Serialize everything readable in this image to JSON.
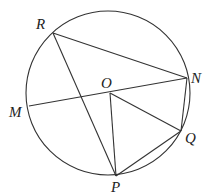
{
  "diagram": {
    "type": "circle-geometry",
    "circle": {
      "center": "O",
      "cx": 108,
      "cy": 93,
      "r": 82
    },
    "points": [
      {
        "name": "R",
        "x": 53,
        "y": 33,
        "lx": 36,
        "ly": 29
      },
      {
        "name": "N",
        "x": 187,
        "y": 78,
        "lx": 191,
        "ly": 83
      },
      {
        "name": "O",
        "x": 110,
        "y": 93,
        "lx": 103,
        "ly": 88
      },
      {
        "name": "M",
        "x": 29,
        "y": 106,
        "lx": 10,
        "ly": 117
      },
      {
        "name": "Q",
        "x": 181,
        "y": 131,
        "lx": 185,
        "ly": 142
      },
      {
        "name": "P",
        "x": 116,
        "y": 176,
        "lx": 110,
        "ly": 192
      }
    ],
    "segments": [
      [
        "R",
        "N"
      ],
      [
        "R",
        "P"
      ],
      [
        "M",
        "N"
      ],
      [
        "O",
        "P"
      ],
      [
        "O",
        "Q"
      ],
      [
        "P",
        "Q"
      ],
      [
        "N",
        "Q"
      ]
    ],
    "labels": {
      "R": "R",
      "N": "N",
      "O": "O",
      "M": "M",
      "Q": "Q",
      "P": "P"
    }
  }
}
